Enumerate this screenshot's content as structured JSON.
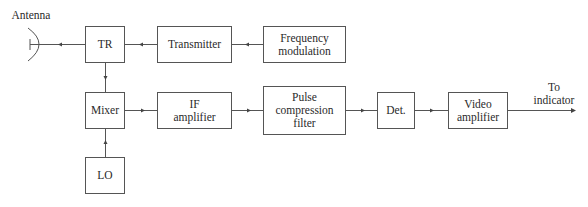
{
  "diagram": {
    "type": "block-diagram",
    "labels": {
      "antenna": "Antenna",
      "output": "To\nindicator"
    },
    "blocks": [
      {
        "id": "tr",
        "label": "TR"
      },
      {
        "id": "transmitter",
        "label": "Transmitter"
      },
      {
        "id": "freq_mod",
        "label": "Frequency\nmodulation"
      },
      {
        "id": "mixer",
        "label": "Mixer"
      },
      {
        "id": "lo",
        "label": "LO"
      },
      {
        "id": "if_amp",
        "label": "IF\namplifier"
      },
      {
        "id": "pulse_comp",
        "label": "Pulse\ncompression\nfilter"
      },
      {
        "id": "det",
        "label": "Det."
      },
      {
        "id": "video_amp",
        "label": "Video\namplifier"
      }
    ],
    "connections": [
      {
        "from": "freq_mod",
        "to": "transmitter"
      },
      {
        "from": "transmitter",
        "to": "tr"
      },
      {
        "from": "tr",
        "to": "antenna"
      },
      {
        "from": "tr",
        "to": "mixer"
      },
      {
        "from": "lo",
        "to": "mixer"
      },
      {
        "from": "mixer",
        "to": "if_amp"
      },
      {
        "from": "if_amp",
        "to": "pulse_comp"
      },
      {
        "from": "pulse_comp",
        "to": "det"
      },
      {
        "from": "det",
        "to": "video_amp"
      },
      {
        "from": "video_amp",
        "to": "output"
      }
    ],
    "colors": {
      "line": "#555555",
      "text": "#2a2a2a",
      "background": "#ffffff"
    }
  }
}
